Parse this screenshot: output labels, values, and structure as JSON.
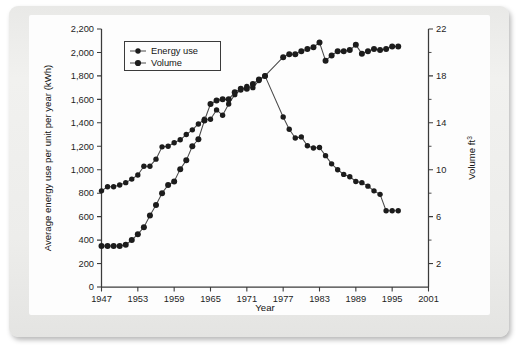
{
  "chart_data": {
    "type": "line",
    "title": "",
    "xlabel": "Year",
    "ylabel": "Average energy use per unit per year (kWh)",
    "ylabel_right": "Volume ft3",
    "ylabel_right_base": "Volume ft",
    "ylabel_right_exp": "3",
    "xlim": [
      1947,
      2001
    ],
    "ylim": [
      0,
      2200
    ],
    "ylim_right": [
      0,
      22
    ],
    "grid": false,
    "legend_position": "top-left",
    "x_ticks": [
      1947,
      1953,
      1959,
      1965,
      1971,
      1977,
      1983,
      1989,
      1995,
      2001
    ],
    "x_tick_labels": [
      "1947",
      "1953",
      "1959",
      "1965",
      "1971",
      "1977",
      "1983",
      "1989",
      "1995",
      "2001"
    ],
    "y_ticks_left": [
      0,
      200,
      400,
      600,
      800,
      1000,
      1200,
      1400,
      1600,
      1800,
      2000,
      2200
    ],
    "y_tick_labels_left": [
      "0",
      "200",
      "400",
      "600",
      "800",
      "1,000",
      "1,200",
      "1,400",
      "1,600",
      "1,800",
      "2,000",
      "2,200"
    ],
    "y_ticks_right": [
      2,
      6,
      10,
      14,
      18,
      22
    ],
    "y_tick_labels_right": [
      "2",
      "6",
      "10",
      "14",
      "18",
      "22"
    ],
    "y_minor_ticks_right": [
      4,
      8,
      12,
      16,
      20
    ],
    "series": [
      {
        "name": "Energy use",
        "axis": "left",
        "unit": "kWh",
        "x": [
          1947,
          1948,
          1949,
          1950,
          1951,
          1952,
          1953,
          1954,
          1955,
          1956,
          1957,
          1958,
          1959,
          1960,
          1961,
          1962,
          1963,
          1964,
          1965,
          1966,
          1967,
          1968,
          1969,
          1970,
          1971,
          1972,
          1973,
          1974,
          1977,
          1978,
          1979,
          1980,
          1981,
          1982,
          1983,
          1984,
          1985,
          1986,
          1987,
          1988,
          1989,
          1990,
          1991,
          1992,
          1993,
          1994,
          1995,
          1996
        ],
        "values": [
          820,
          855,
          855,
          870,
          890,
          920,
          955,
          1030,
          1030,
          1090,
          1195,
          1200,
          1230,
          1255,
          1300,
          1340,
          1390,
          1430,
          1430,
          1510,
          1465,
          1560,
          1640,
          1680,
          1710,
          1700,
          1760,
          1800,
          1450,
          1345,
          1270,
          1280,
          1205,
          1185,
          1190,
          1120,
          1050,
          1000,
          960,
          940,
          900,
          890,
          860,
          820,
          790,
          650,
          650,
          650
        ]
      },
      {
        "name": "Volume",
        "axis": "right",
        "unit": "ft3",
        "x": [
          1947,
          1948,
          1949,
          1950,
          1951,
          1952,
          1953,
          1954,
          1955,
          1956,
          1957,
          1958,
          1959,
          1960,
          1961,
          1962,
          1963,
          1964,
          1965,
          1966,
          1967,
          1968,
          1969,
          1970,
          1971,
          1972,
          1973,
          1974,
          1977,
          1978,
          1979,
          1980,
          1981,
          1982,
          1983,
          1984,
          1985,
          1986,
          1987,
          1988,
          1989,
          1990,
          1991,
          1992,
          1993,
          1994,
          1995,
          1996
        ],
        "values_left_scale": [
          350,
          350,
          350,
          350,
          360,
          400,
          450,
          510,
          610,
          700,
          800,
          870,
          900,
          1005,
          1080,
          1200,
          1260,
          1420,
          1560,
          1590,
          1600,
          1600,
          1660,
          1690,
          1690,
          1730,
          1770,
          1800,
          1960,
          1985,
          1985,
          2010,
          2030,
          2045,
          2085,
          1930,
          1975,
          2010,
          2010,
          2020,
          2065,
          1990,
          2010,
          2030,
          2020,
          2030,
          2050,
          2050
        ],
        "values": [
          3.5,
          3.5,
          3.5,
          3.5,
          3.6,
          4.0,
          4.5,
          5.1,
          6.1,
          7.0,
          8.0,
          8.7,
          9.0,
          10.05,
          10.8,
          12.0,
          12.6,
          14.2,
          15.6,
          15.9,
          16.0,
          16.0,
          16.6,
          16.9,
          16.9,
          17.3,
          17.7,
          18.0,
          19.6,
          19.85,
          19.85,
          20.1,
          20.3,
          20.45,
          20.85,
          19.3,
          19.75,
          20.1,
          20.1,
          20.2,
          20.65,
          19.9,
          20.1,
          20.3,
          20.2,
          20.3,
          20.5,
          20.5
        ]
      }
    ],
    "gaps": [
      {
        "after_year": 1974,
        "before_year": 1977
      }
    ],
    "annotations": [],
    "colors": {
      "line": "#4a4a4a",
      "marker": "#1c1c1c",
      "axis": "#3b3b3b",
      "plot_background": "#fdfdfd",
      "page_background": "#eeeeec"
    }
  },
  "legend": {
    "items": [
      {
        "label": "Energy use"
      },
      {
        "label": "Volume"
      }
    ]
  }
}
